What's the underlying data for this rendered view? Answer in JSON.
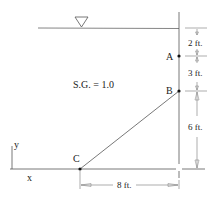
{
  "diagram": {
    "fluid": {
      "specific_gravity_label": "S.G. = 1.0"
    },
    "points": {
      "A": {
        "label": "A"
      },
      "B": {
        "label": "B"
      },
      "C": {
        "label": "C"
      }
    },
    "dimensions": {
      "surface_to_A": "2 ft.",
      "A_to_B": "3 ft.",
      "B_to_base": "6 ft.",
      "C_to_wall": "8 ft."
    },
    "axes": {
      "x_label": "x",
      "y_label": "y"
    },
    "free_surface_symbol": "triangle-down",
    "colors": {
      "line": "#555555",
      "text": "#222222",
      "background": "#ffffff"
    }
  }
}
